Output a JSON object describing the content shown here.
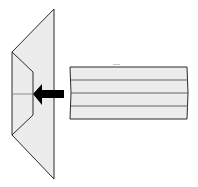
{
  "diagram": {
    "title": "",
    "colors": {
      "background": "#ffffff",
      "fill": "#ececec",
      "stroke": "#2a2a2a",
      "arrow": "#000000",
      "inner_line": "#555555"
    },
    "shapes": {
      "funnel": {
        "label": "",
        "outer": [
          [
            54,
            9
          ],
          [
            12,
            52
          ],
          [
            12,
            135
          ],
          [
            54,
            179
          ]
        ],
        "inner": [
          [
            12,
            52
          ],
          [
            33,
            72
          ],
          [
            33,
            115
          ],
          [
            12,
            135
          ]
        ],
        "midline_y": 94
      },
      "arrow": {
        "label": "",
        "direction": "left",
        "tail": [
          64,
          94
        ],
        "head": [
          33,
          94
        ]
      },
      "cylinder": {
        "label": "",
        "x": 69,
        "y": 67,
        "width": 119,
        "height": 52,
        "divisions": 4
      }
    }
  }
}
